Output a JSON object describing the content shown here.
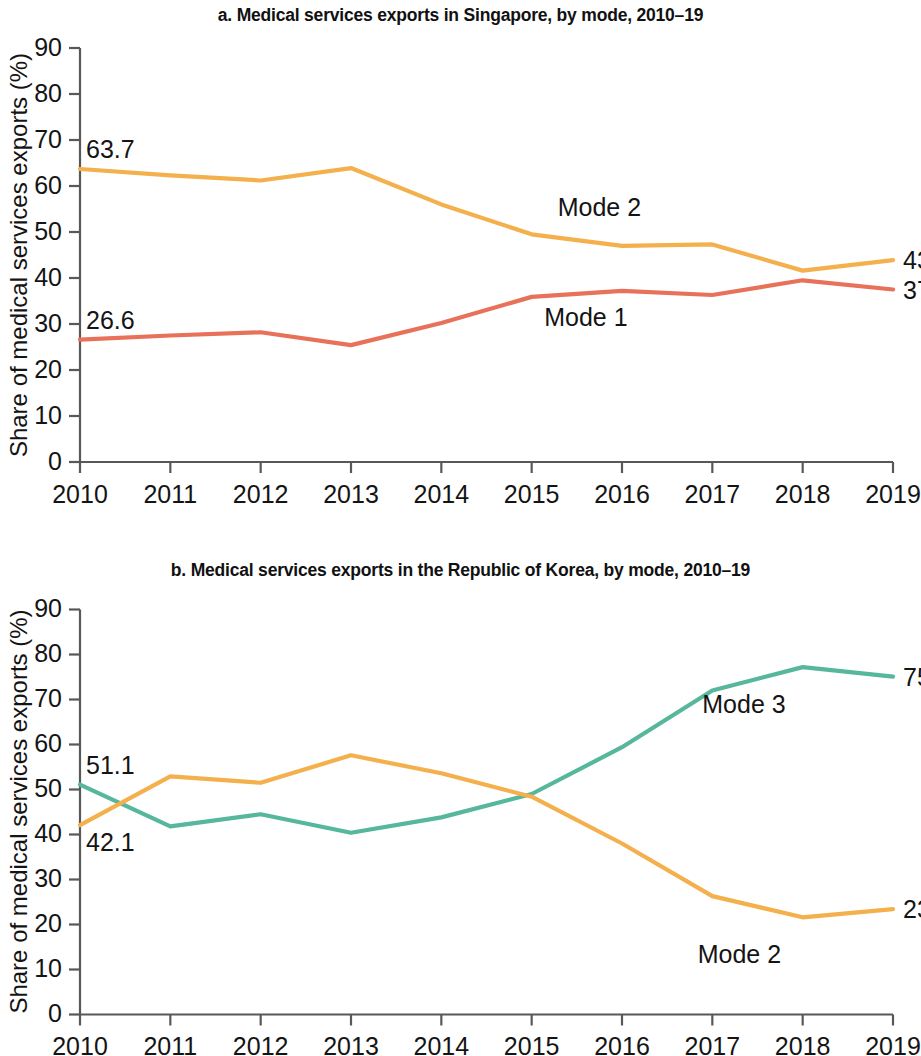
{
  "figure": {
    "panels": [
      {
        "id": "a",
        "title": "a. Medical services exports in Singapore, by mode, 2010–19"
      },
      {
        "id": "b",
        "title": "b. Medical services exports in the Republic of Korea, by mode, 2010–19"
      }
    ]
  },
  "chart_data": [
    {
      "type": "line",
      "panel": "a",
      "title": "a. Medical services exports in Singapore, by mode, 2010–19",
      "xlabel": "",
      "ylabel": "Share of medical services exports (%)",
      "x": [
        2010,
        2011,
        2012,
        2013,
        2014,
        2015,
        2016,
        2017,
        2018,
        2019
      ],
      "categories": [
        "2010",
        "2011",
        "2012",
        "2013",
        "2014",
        "2015",
        "2016",
        "2017",
        "2018",
        "2019"
      ],
      "xtick_labels": [
        "2010",
        "2011",
        "2012",
        "2013",
        "2014",
        "2015",
        "2016",
        "2017",
        "2018",
        "2019"
      ],
      "ytick_labels": [
        "0",
        "10",
        "20",
        "30",
        "40",
        "50",
        "60",
        "70",
        "80",
        "90"
      ],
      "yticks": [
        0,
        10,
        20,
        30,
        40,
        50,
        60,
        70,
        80,
        90
      ],
      "ylim": [
        0,
        90
      ],
      "grid": false,
      "legend": "inline-annotations",
      "series": [
        {
          "name": "Mode 2",
          "color": "#F3B04C",
          "values": [
            63.7,
            62.3,
            61.2,
            63.9,
            56.0,
            49.5,
            47.0,
            47.3,
            41.6,
            43.9
          ],
          "label_text": "Mode 2",
          "start_label": "63.7",
          "end_label": "43.9"
        },
        {
          "name": "Mode 1",
          "color": "#E8715A",
          "values": [
            26.6,
            27.5,
            28.2,
            25.4,
            30.2,
            35.9,
            37.2,
            36.3,
            39.5,
            37.5
          ],
          "label_text": "Mode 1",
          "start_label": "26.6",
          "end_label": "37.5"
        }
      ]
    },
    {
      "type": "line",
      "panel": "b",
      "title": "b. Medical services exports in the Republic of Korea, by mode, 2010–19",
      "xlabel": "",
      "ylabel": "Share of medical services exports (%)",
      "x": [
        2010,
        2011,
        2012,
        2013,
        2014,
        2015,
        2016,
        2017,
        2018,
        2019
      ],
      "categories": [
        "2010",
        "2011",
        "2012",
        "2013",
        "2014",
        "2015",
        "2016",
        "2017",
        "2018",
        "2019"
      ],
      "xtick_labels": [
        "2010",
        "2011",
        "2012",
        "2013",
        "2014",
        "2015",
        "2016",
        "2017",
        "2018",
        "2019"
      ],
      "ytick_labels": [
        "0",
        "10",
        "20",
        "30",
        "40",
        "50",
        "60",
        "70",
        "80",
        "90"
      ],
      "yticks": [
        0,
        10,
        20,
        30,
        40,
        50,
        60,
        70,
        80,
        90
      ],
      "ylim": [
        0,
        90
      ],
      "grid": false,
      "legend": "inline-annotations",
      "series": [
        {
          "name": "Mode 3",
          "color": "#56B79C",
          "values": [
            51.1,
            41.8,
            44.5,
            40.4,
            43.8,
            49.0,
            59.4,
            72.0,
            77.2,
            75.1
          ],
          "label_text": "Mode 3",
          "start_label": "51.1",
          "end_label": "75.1"
        },
        {
          "name": "Mode 2",
          "color": "#F3B04C",
          "values": [
            42.1,
            52.9,
            51.5,
            57.6,
            53.6,
            48.4,
            38.0,
            26.3,
            21.6,
            23.4
          ],
          "label_text": "Mode 2",
          "start_label": "42.1",
          "end_label": "23.4"
        }
      ]
    }
  ]
}
